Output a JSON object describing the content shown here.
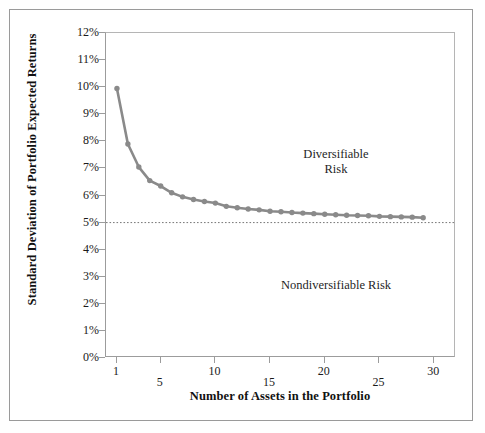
{
  "chart_data": {
    "type": "line",
    "title": "",
    "xlabel": "Number of Assets in the Portfolio",
    "ylabel": "Standard Deviation of Portfolio Expected Returns",
    "xlim": [
      0,
      32
    ],
    "ylim": [
      0,
      12
    ],
    "grid": false,
    "legend": "none",
    "x": [
      1,
      2,
      3,
      4,
      5,
      6,
      7,
      8,
      9,
      10,
      11,
      12,
      13,
      14,
      15,
      16,
      17,
      18,
      19,
      20,
      21,
      22,
      23,
      24,
      25,
      26,
      27,
      28,
      29
    ],
    "values": [
      9.95,
      7.9,
      7.05,
      6.55,
      6.35,
      6.1,
      5.95,
      5.85,
      5.78,
      5.72,
      5.6,
      5.55,
      5.5,
      5.47,
      5.42,
      5.4,
      5.37,
      5.35,
      5.33,
      5.31,
      5.29,
      5.27,
      5.26,
      5.25,
      5.23,
      5.22,
      5.21,
      5.2,
      5.18
    ],
    "series": [
      {
        "name": "Portfolio standard deviation",
        "color": "#8a8a8a",
        "marker": "circle",
        "values": [
          9.95,
          7.9,
          7.05,
          6.55,
          6.35,
          6.1,
          5.95,
          5.85,
          5.78,
          5.72,
          5.6,
          5.55,
          5.5,
          5.47,
          5.42,
          5.4,
          5.37,
          5.35,
          5.33,
          5.31,
          5.29,
          5.27,
          5.26,
          5.25,
          5.23,
          5.22,
          5.21,
          5.2,
          5.18
        ]
      }
    ],
    "reference_lines": [
      {
        "name": "nondiversifiable-risk-level",
        "orientation": "horizontal",
        "value": 5,
        "style": "dotted",
        "color": "#777777"
      }
    ],
    "y_ticks": [
      {
        "value": 12,
        "label": "12%"
      },
      {
        "value": 11,
        "label": "11%"
      },
      {
        "value": 10,
        "label": "10%"
      },
      {
        "value": 9,
        "label": "9%"
      },
      {
        "value": 8,
        "label": "8%"
      },
      {
        "value": 7,
        "label": "7%"
      },
      {
        "value": 6,
        "label": "6%"
      },
      {
        "value": 5,
        "label": "5%"
      },
      {
        "value": 4,
        "label": "4%"
      },
      {
        "value": 3,
        "label": "3%"
      },
      {
        "value": 2,
        "label": "2%"
      },
      {
        "value": 1,
        "label": "1%"
      },
      {
        "value": 0,
        "label": "0%"
      }
    ],
    "x_ticks": [
      {
        "value": 1,
        "label": "1",
        "row": "top"
      },
      {
        "value": 5,
        "label": "5",
        "row": "bottom"
      },
      {
        "value": 10,
        "label": "10",
        "row": "top"
      },
      {
        "value": 15,
        "label": "15",
        "row": "bottom"
      },
      {
        "value": 20,
        "label": "20",
        "row": "top"
      },
      {
        "value": 25,
        "label": "25",
        "row": "bottom"
      },
      {
        "value": 30,
        "label": "30",
        "row": "top"
      }
    ],
    "annotations": [
      {
        "name": "diversifiable-risk",
        "text": "Diversifiable\nRisk",
        "x": 13.5,
        "y": 7.6
      },
      {
        "name": "nondiversifiable-risk",
        "text": "Nondiversifiable Risk",
        "x": 13.5,
        "y": 2.9
      }
    ]
  },
  "colors": {
    "series": "#8a8a8a",
    "axis": "#9c9c9c",
    "frame": "#9a9a9a",
    "text": "#1a1a1a",
    "reference_line": "#777777"
  }
}
